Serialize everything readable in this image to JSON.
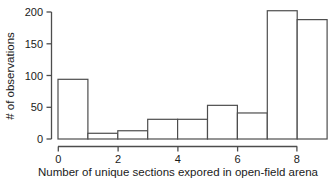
{
  "chart_data": {
    "type": "bar",
    "title": "",
    "xlabel": "Number of unique sections expored in open-field arena",
    "ylabel": "# of observations",
    "bin_edges": [
      0,
      1,
      2,
      3,
      4,
      5,
      6,
      7,
      8,
      9
    ],
    "categories": [
      "0-1",
      "1-2",
      "2-3",
      "3-4",
      "4-5",
      "5-6",
      "6-7",
      "7-8",
      "8-9"
    ],
    "values": [
      94,
      9,
      13,
      31,
      31,
      53,
      41,
      202,
      188
    ],
    "xlim": [
      0,
      9
    ],
    "ylim": [
      0,
      210
    ],
    "xticks": [
      0,
      2,
      4,
      6,
      8
    ],
    "xtick_labels": [
      "0",
      "2",
      "4",
      "6",
      "8"
    ],
    "yticks": [
      0,
      50,
      100,
      150,
      200
    ],
    "ytick_labels": [
      "0",
      "50",
      "100",
      "150",
      "200"
    ],
    "grid": false,
    "legend": null,
    "bar_fill": "#ffffff",
    "bar_edge": "#4d4d4d",
    "axis_color": "#4d4d4d"
  }
}
